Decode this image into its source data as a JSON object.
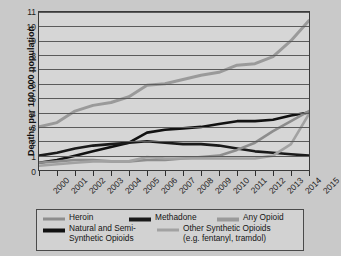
{
  "chart_data": {
    "type": "line",
    "title": "",
    "xlabel": "",
    "ylabel": "Deaths per 100,000 population",
    "x": [
      2000,
      2001,
      2002,
      2003,
      2004,
      2005,
      2006,
      2007,
      2008,
      2009,
      2010,
      2011,
      2012,
      2013,
      2014,
      2015
    ],
    "categories": [
      "2000",
      "2001",
      "2002",
      "2003",
      "2004",
      "2005",
      "2006",
      "2007",
      "2008",
      "2009",
      "2010",
      "2011",
      "2012",
      "2013",
      "2014",
      "2015"
    ],
    "ylim": [
      0,
      11
    ],
    "yticks": [
      0,
      1,
      2,
      3,
      4,
      5,
      6,
      7,
      8,
      9,
      10,
      11
    ],
    "grid": true,
    "legend_position": "bottom",
    "series": [
      {
        "name": "Any Opioid",
        "color": "#9a9a9a",
        "width": 3.0,
        "values": [
          3.0,
          3.3,
          4.1,
          4.5,
          4.7,
          5.1,
          5.9,
          6.0,
          6.3,
          6.6,
          6.8,
          7.3,
          7.4,
          7.9,
          9.0,
          10.4
        ]
      },
      {
        "name": "Natural and Semi-Synthetic Opioids",
        "color": "#111111",
        "width": 2.6,
        "values": [
          0.5,
          0.7,
          1.0,
          1.3,
          1.6,
          1.9,
          2.6,
          2.8,
          2.9,
          3.0,
          3.2,
          3.4,
          3.4,
          3.5,
          3.8,
          4.0
        ]
      },
      {
        "name": "Methadone",
        "color": "#1a1a1a",
        "width": 2.6,
        "values": [
          1.0,
          1.2,
          1.5,
          1.7,
          1.8,
          1.9,
          2.0,
          1.9,
          1.8,
          1.8,
          1.7,
          1.5,
          1.3,
          1.2,
          1.1,
          1.0
        ]
      },
      {
        "name": "Heroin",
        "color": "#8d8d8d",
        "width": 2.6,
        "values": [
          0.5,
          0.6,
          0.7,
          0.7,
          0.6,
          0.6,
          0.7,
          0.7,
          0.8,
          0.9,
          1.0,
          1.4,
          1.9,
          2.7,
          3.4,
          4.1
        ]
      },
      {
        "name": "Other Synthetic Opioids (e.g. fentanyl, tramdol)",
        "color": "#a2a2a2",
        "width": 2.6,
        "values": [
          0.3,
          0.4,
          0.5,
          0.6,
          0.6,
          0.6,
          0.9,
          0.8,
          0.8,
          0.8,
          0.8,
          0.8,
          0.8,
          1.0,
          1.8,
          3.9
        ]
      }
    ]
  },
  "legend": {
    "items": [
      {
        "label": "Heroin",
        "name": "legend-heroin"
      },
      {
        "label": "Methadone",
        "name": "legend-methadone"
      },
      {
        "label": "Any Opioid",
        "name": "legend-any-opioid"
      },
      {
        "label": "Natural and Semi-Synthetic Opioids",
        "line1": "Natural and Semi-",
        "line2": "Synthetic Opioids",
        "name": "legend-natural"
      },
      {
        "label": "Other Synthetic Opioids (e.g. fentanyl, tramdol)",
        "line1": "Other Synthetic Opioids",
        "line2": "(e.g. fentanyl, tramdol)",
        "name": "legend-other-synthetic"
      }
    ]
  },
  "colors": {
    "background": "#c9c9c9",
    "plot_background": "#d6d6d6",
    "grid": "#5b5b5b",
    "axis": "#2e2e2e",
    "text": "#141414"
  }
}
